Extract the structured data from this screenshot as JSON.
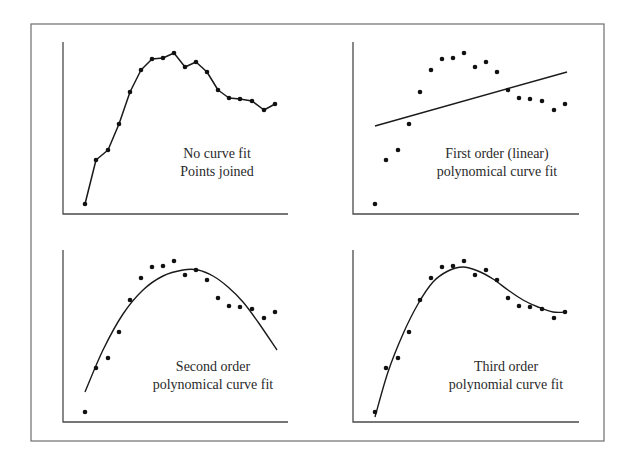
{
  "figure": {
    "frame": {
      "x": 31,
      "y": 24,
      "width": 573,
      "height": 417
    },
    "colors": {
      "ink": "#111111",
      "axis": "#4a4a4a",
      "frame": "#6e6e6e",
      "text": "#2a2a2a"
    }
  },
  "panels": [
    {
      "id": "no-fit",
      "label_line1": "No curve fit",
      "label_line2": "Points joined",
      "origin": [
        63,
        214
      ],
      "axis_height": 172,
      "axis_width": 225,
      "label_pos": [
        217,
        158
      ],
      "fit": "joined"
    },
    {
      "id": "linear",
      "label_line1": "First order (linear)",
      "label_line2": "polynomical curve fit",
      "origin": [
        353,
        214
      ],
      "axis_height": 172,
      "axis_width": 226,
      "label_pos": [
        497,
        158
      ],
      "fit": "linear"
    },
    {
      "id": "quadratic",
      "label_line1": "Second order",
      "label_line2": "polynomical curve fit",
      "origin": [
        63,
        422
      ],
      "axis_height": 172,
      "axis_width": 225,
      "label_pos": [
        213,
        371
      ],
      "fit": "quadratic"
    },
    {
      "id": "cubic",
      "label_line1": "Third order",
      "label_line2": "polynomial curve fit",
      "origin": [
        353,
        422
      ],
      "axis_height": 172,
      "axis_width": 226,
      "label_pos": [
        506,
        371
      ],
      "fit": "cubic"
    }
  ],
  "chart_data": [
    {
      "type": "line",
      "title": "No curve fit / Points joined",
      "xlabel": "",
      "ylabel": "",
      "grid": false,
      "x": [
        22,
        33,
        45,
        56,
        67,
        78,
        89,
        100,
        111,
        122,
        133,
        144,
        155,
        166,
        177,
        189,
        201,
        212
      ],
      "series": [
        {
          "name": "data (points joined)",
          "values": [
            10,
            54,
            64,
            90,
            122,
            144,
            155,
            156,
            161,
            147,
            152,
            142,
            124,
            116,
            115,
            113,
            104,
            110
          ]
        }
      ]
    },
    {
      "type": "scatter",
      "title": "First order (linear) polynomical curve fit",
      "xlabel": "",
      "ylabel": "",
      "grid": false,
      "x": [
        22,
        33,
        45,
        56,
        67,
        78,
        89,
        100,
        111,
        122,
        133,
        144,
        155,
        166,
        177,
        189,
        201,
        212
      ],
      "series": [
        {
          "name": "data",
          "values": [
            10,
            54,
            64,
            90,
            122,
            144,
            155,
            156,
            161,
            147,
            152,
            142,
            124,
            116,
            115,
            113,
            104,
            110
          ]
        },
        {
          "name": "linear fit",
          "endpoints": [
            [
              22,
              88
            ],
            [
              214,
              142
            ]
          ]
        }
      ]
    },
    {
      "type": "scatter",
      "title": "Second order polynomical curve fit",
      "xlabel": "",
      "ylabel": "",
      "grid": false,
      "x": [
        22,
        33,
        45,
        56,
        67,
        78,
        89,
        100,
        111,
        122,
        133,
        144,
        155,
        166,
        177,
        189,
        201,
        212
      ],
      "series": [
        {
          "name": "data",
          "values": [
            10,
            54,
            64,
            90,
            122,
            144,
            155,
            156,
            161,
            147,
            152,
            142,
            124,
            116,
            115,
            113,
            104,
            110
          ]
        },
        {
          "name": "quadratic fit",
          "curve": [
            [
              22,
              30
            ],
            [
              40,
              72
            ],
            [
              60,
              108
            ],
            [
              80,
              132
            ],
            [
              100,
              146
            ],
            [
              120,
              152
            ],
            [
              135,
              152
            ],
            [
              150,
              146
            ],
            [
              165,
              135
            ],
            [
              180,
              120
            ],
            [
              195,
              100
            ],
            [
              214,
              72
            ]
          ]
        }
      ]
    },
    {
      "type": "scatter",
      "title": "Third order polynomial curve fit",
      "xlabel": "",
      "ylabel": "",
      "grid": false,
      "x": [
        22,
        33,
        45,
        56,
        67,
        78,
        89,
        100,
        111,
        122,
        133,
        144,
        155,
        166,
        177,
        189,
        201,
        212
      ],
      "series": [
        {
          "name": "data",
          "values": [
            10,
            54,
            64,
            90,
            122,
            144,
            155,
            156,
            161,
            147,
            152,
            142,
            124,
            116,
            115,
            113,
            104,
            110
          ]
        },
        {
          "name": "cubic fit",
          "curve": [
            [
              22,
              5
            ],
            [
              35,
              50
            ],
            [
              50,
              88
            ],
            [
              65,
              118
            ],
            [
              80,
              140
            ],
            [
              95,
              151
            ],
            [
              110,
              155
            ],
            [
              125,
              151
            ],
            [
              140,
              143
            ],
            [
              155,
              132
            ],
            [
              170,
              122
            ],
            [
              185,
              115
            ],
            [
              200,
              110
            ],
            [
              214,
              110
            ]
          ]
        }
      ]
    }
  ]
}
